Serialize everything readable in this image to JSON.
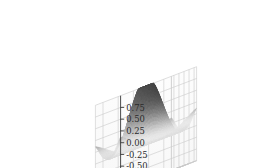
{
  "figure": {
    "kind": "matplotlib-3d-surface",
    "background_color": "#ffffff",
    "pane_color": "#fbfbfb",
    "grid_color": "#c9c9c9",
    "axis_line_color": "#2b2b2b",
    "tick_text_color": "#2b2b2b",
    "colormap": "grayscale",
    "surface_light_color": "#f2f2f2",
    "surface_dark_color": "#3a3a3a"
  },
  "axes": {
    "x": {
      "name": "x-axis",
      "ticks": [
        "-4",
        "-2",
        "0",
        "2",
        "4"
      ],
      "values": [
        -4,
        -2,
        0,
        2,
        4
      ],
      "range": [
        -5,
        5
      ]
    },
    "y": {
      "name": "y-axis",
      "ticks": [
        "-4",
        "-2",
        "0",
        "2",
        "4"
      ],
      "values": [
        -4,
        -2,
        0,
        2,
        4
      ],
      "range": [
        -5,
        5
      ]
    },
    "z": {
      "name": "z-axis",
      "ticks": [
        "0.75",
        "0.50",
        "0.25",
        "0.00",
        "-0.25",
        "-0.50",
        "-0.75"
      ],
      "values": [
        0.75,
        0.5,
        0.25,
        0.0,
        -0.25,
        -0.5,
        -0.75
      ],
      "range": [
        -1.0,
        1.0
      ]
    }
  },
  "chart_data": {
    "type": "surface",
    "title": "",
    "xlabel": "",
    "ylabel": "",
    "zlabel": "",
    "grid": true,
    "legend": false,
    "colormap": "gray",
    "projection": "3d",
    "view": {
      "elevation": 28,
      "azimuth": -60
    },
    "function": "z = sin(sqrt(x^2 + y^2)) / sqrt(x^2 + y^2)  (radial sinc, clipped plateau at center)",
    "xlim": [
      -5,
      5
    ],
    "ylim": [
      -5,
      5
    ],
    "zlim": [
      -1.0,
      1.0
    ],
    "x_ticks": [
      -4,
      -2,
      0,
      2,
      4
    ],
    "y_ticks": [
      -4,
      -2,
      0,
      2,
      4
    ],
    "z_ticks": [
      0.75,
      0.5,
      0.25,
      0.0,
      -0.25,
      -0.5,
      -0.75
    ],
    "x": [
      -5,
      -4,
      -3,
      -2,
      -1,
      0,
      1,
      2,
      3,
      4,
      5
    ],
    "y": [
      -5,
      -4,
      -3,
      -2,
      -1,
      0,
      1,
      2,
      3,
      4,
      5
    ],
    "z_matrix": [
      [
        0.1,
        -0.05,
        -0.19,
        -0.21,
        -0.1,
        -0.04,
        -0.1,
        -0.21,
        -0.19,
        -0.05,
        0.1
      ],
      [
        -0.05,
        -0.21,
        -0.25,
        -0.13,
        0.08,
        0.18,
        0.08,
        -0.13,
        -0.25,
        -0.21,
        -0.05
      ],
      [
        -0.19,
        -0.25,
        -0.1,
        0.18,
        0.44,
        0.55,
        0.44,
        0.18,
        -0.1,
        -0.25,
        -0.19
      ],
      [
        -0.21,
        -0.13,
        0.18,
        0.55,
        0.84,
        0.91,
        0.84,
        0.55,
        0.18,
        -0.13,
        -0.21
      ],
      [
        -0.1,
        0.08,
        0.44,
        0.84,
        0.99,
        1.0,
        0.99,
        0.84,
        0.44,
        0.08,
        -0.1
      ],
      [
        -0.04,
        0.18,
        0.55,
        0.91,
        1.0,
        1.0,
        1.0,
        0.91,
        0.55,
        0.18,
        -0.04
      ],
      [
        -0.1,
        0.08,
        0.44,
        0.84,
        0.99,
        1.0,
        0.99,
        0.84,
        0.44,
        0.08,
        -0.1
      ],
      [
        -0.21,
        -0.13,
        0.18,
        0.55,
        0.84,
        0.91,
        0.84,
        0.55,
        0.18,
        -0.13,
        -0.21
      ],
      [
        -0.19,
        -0.25,
        -0.1,
        0.18,
        0.44,
        0.55,
        0.44,
        0.18,
        -0.1,
        -0.25,
        -0.19
      ],
      [
        -0.05,
        -0.21,
        -0.25,
        -0.13,
        0.08,
        0.18,
        0.08,
        -0.13,
        -0.25,
        -0.21,
        -0.05
      ],
      [
        0.1,
        -0.05,
        -0.19,
        -0.21,
        -0.1,
        -0.04,
        -0.1,
        -0.21,
        -0.19,
        -0.05,
        0.1
      ]
    ],
    "z_min": -0.26,
    "z_max": 1.0,
    "annotations": []
  },
  "ticks_rendered": {
    "z": [
      {
        "label": "0.75",
        "x": 243,
        "y": 31
      },
      {
        "label": "0.50",
        "x": 243,
        "y": 42
      },
      {
        "label": "0.25",
        "x": 243,
        "y": 53
      },
      {
        "label": "0.00",
        "x": 243,
        "y": 64
      },
      {
        "label": "-0.25",
        "x": 241,
        "y": 75
      },
      {
        "label": "-0.50",
        "x": 241,
        "y": 86
      },
      {
        "label": "-0.75",
        "x": 241,
        "y": 97
      }
    ],
    "x": [
      {
        "label": "-4",
        "x": 30,
        "y": 140
      },
      {
        "label": "-2",
        "x": 64,
        "y": 146
      },
      {
        "label": "0",
        "x": 98,
        "y": 152
      },
      {
        "label": "2",
        "x": 132,
        "y": 158
      },
      {
        "label": "4",
        "x": 166,
        "y": 164
      }
    ],
    "y": [
      {
        "label": "-4",
        "x": 169,
        "y": 149
      },
      {
        "label": "-2",
        "x": 189,
        "y": 142
      },
      {
        "label": "0",
        "x": 207,
        "y": 135
      },
      {
        "label": "2",
        "x": 224,
        "y": 128
      },
      {
        "label": "4",
        "x": 240,
        "y": 121
      }
    ]
  }
}
